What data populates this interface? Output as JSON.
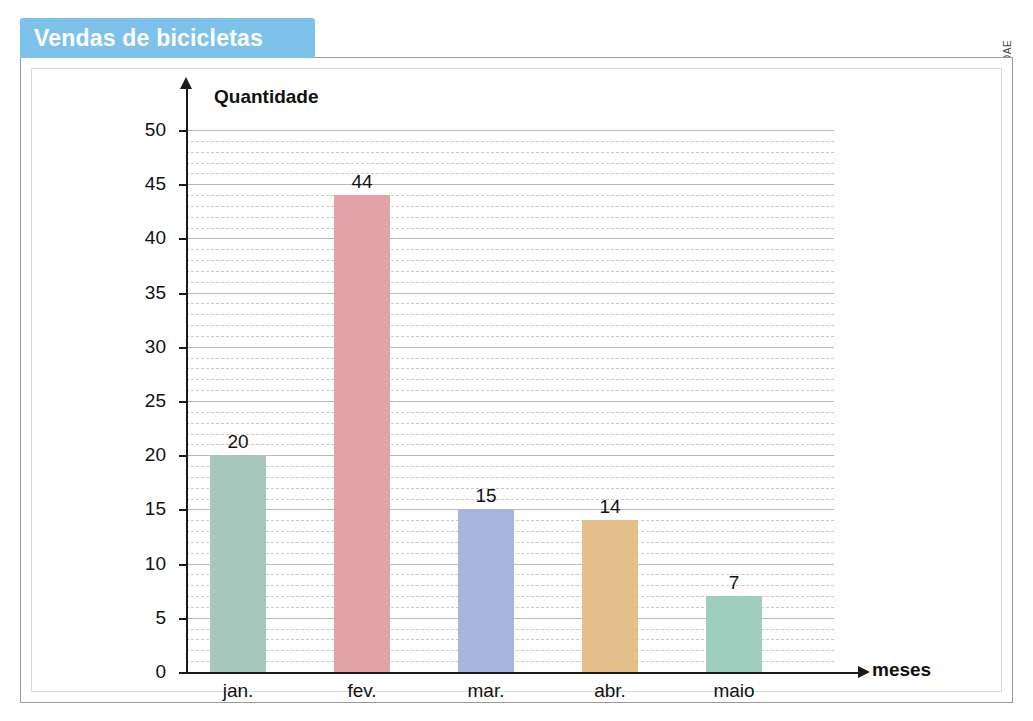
{
  "banner": {
    "title": "Vendas de bicicletas"
  },
  "credit": {
    "label": "DAE"
  },
  "chart_data": {
    "type": "bar",
    "title": "Vendas de bicicletas",
    "xlabel": "meses",
    "ylabel": "Quantidade",
    "categories": [
      "jan.",
      "fev.",
      "mar.",
      "abr.",
      "maio"
    ],
    "values": [
      20,
      44,
      15,
      14,
      7
    ],
    "value_labels": [
      "20",
      "44",
      "15",
      "14",
      "7"
    ],
    "bar_colors": [
      "#a7c7bc",
      "#e2a3a8",
      "#a9b4dc",
      "#e5c08b",
      "#9fcdbe"
    ],
    "ylim": [
      0,
      50
    ],
    "ytick_labels": [
      "0",
      "5",
      "10",
      "15",
      "20",
      "25",
      "30",
      "35",
      "40",
      "45",
      "50"
    ],
    "ytick_values": [
      0,
      5,
      10,
      15,
      20,
      25,
      30,
      35,
      40,
      45,
      50
    ],
    "grid": "horizontal dashed minor lines with solid major lines every 5 units",
    "legend": "none"
  }
}
